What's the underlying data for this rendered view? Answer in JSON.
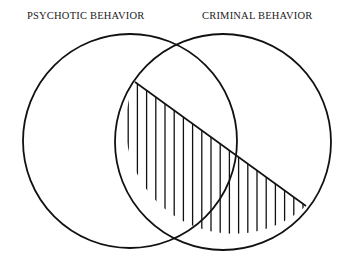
{
  "diagram": {
    "type": "venn",
    "sets": [
      {
        "label": "PSYCHOTIC BEHAVIOR",
        "cx": 130,
        "cy": 141,
        "r": 107
      },
      {
        "label": "CRIMINAL BEHAVIOR",
        "cx": 223,
        "cy": 142,
        "r": 108
      }
    ],
    "shaded_region": {
      "description": "Portion of CRIMINAL BEHAVIOR circle below diagonal chord, hatched with vertical lines",
      "chord": {
        "x1": 135,
        "y1": 82,
        "x2": 306,
        "y2": 206
      },
      "hatch": "vertical",
      "hatch_spacing": 9.2
    },
    "colors": {
      "stroke": "#111111",
      "background": "#ffffff"
    }
  }
}
